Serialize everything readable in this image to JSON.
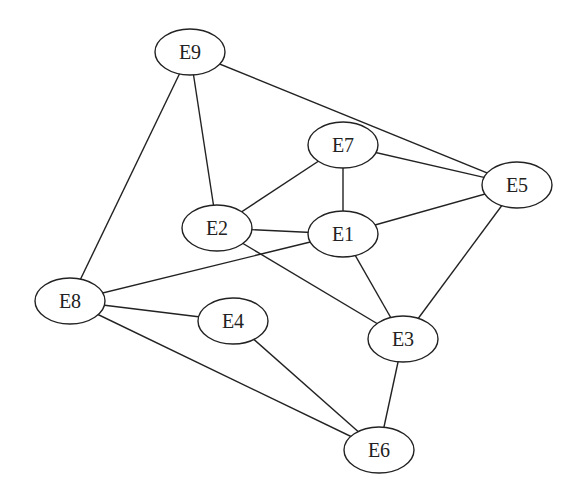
{
  "diagram": {
    "type": "undirected-graph",
    "nodes": [
      {
        "id": "E9",
        "label": "E9",
        "x": 190,
        "y": 52
      },
      {
        "id": "E7",
        "label": "E7",
        "x": 343,
        "y": 145
      },
      {
        "id": "E5",
        "label": "E5",
        "x": 517,
        "y": 185
      },
      {
        "id": "E2",
        "label": "E2",
        "x": 217,
        "y": 228
      },
      {
        "id": "E1",
        "label": "E1",
        "x": 343,
        "y": 234
      },
      {
        "id": "E8",
        "label": "E8",
        "x": 70,
        "y": 301
      },
      {
        "id": "E4",
        "label": "E4",
        "x": 233,
        "y": 321
      },
      {
        "id": "E3",
        "label": "E3",
        "x": 403,
        "y": 339
      },
      {
        "id": "E6",
        "label": "E6",
        "x": 379,
        "y": 450
      }
    ],
    "edges": [
      [
        "E9",
        "E5"
      ],
      [
        "E9",
        "E2"
      ],
      [
        "E9",
        "E8"
      ],
      [
        "E7",
        "E5"
      ],
      [
        "E7",
        "E2"
      ],
      [
        "E7",
        "E1"
      ],
      [
        "E1",
        "E5"
      ],
      [
        "E2",
        "E1"
      ],
      [
        "E2",
        "E3"
      ],
      [
        "E1",
        "E8"
      ],
      [
        "E1",
        "E3"
      ],
      [
        "E5",
        "E3"
      ],
      [
        "E8",
        "E4"
      ],
      [
        "E8",
        "E6"
      ],
      [
        "E4",
        "E6"
      ],
      [
        "E3",
        "E6"
      ]
    ]
  }
}
